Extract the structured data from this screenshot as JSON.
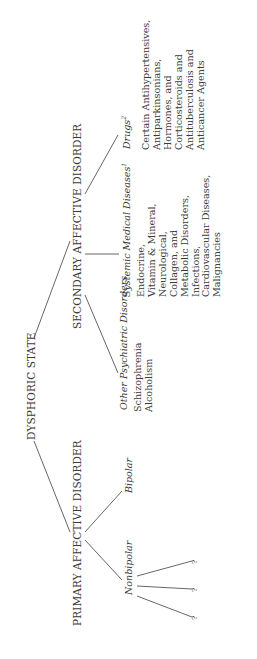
{
  "diagram": {
    "root": "DYSPHORIC STATE",
    "primary": {
      "label": "PRIMARY AFFECTIVE DISORDER",
      "children": {
        "bipolar": "Bipolar",
        "nonbipolar": "Nonbipolar",
        "nonbipolar_children": [
          "?",
          "?",
          "?"
        ]
      }
    },
    "secondary": {
      "label": "SECONDARY AFFECTIVE DISORDER",
      "other_psychiatric": {
        "label": "Other Psychiatric Disorders",
        "items": [
          "Schizophrenia",
          "Alcoholism"
        ]
      },
      "systemic": {
        "label": "Systemic Medical Diseases",
        "sup": "1",
        "items": [
          "Endocrine,",
          "Vitamin & Mineral,",
          "Neurological,",
          "Collagen, and",
          "Metabolic Disorders,",
          "Infections,",
          "Cardiovascular Diseases,",
          "Malignancies"
        ]
      },
      "drugs": {
        "label": "Drugs",
        "sup": "2",
        "items": [
          "Certain Antihypertensives,",
          "Antiparkinsonians,",
          "Hormones, and",
          "Corticosteroids and",
          "Antituberculosis and",
          "Anticancer Agents"
        ]
      }
    }
  }
}
